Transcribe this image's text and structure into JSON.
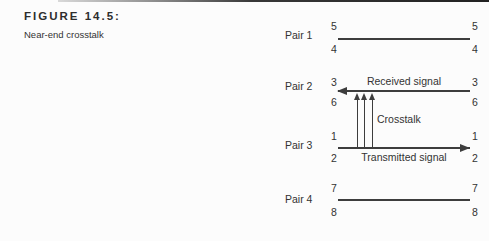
{
  "figure": {
    "title": "FIGURE 14.5:",
    "caption": "Near-end crosstalk"
  },
  "diagram": {
    "pairs": [
      {
        "label": "Pair 1",
        "top_wire": "5",
        "bottom_wire": "4",
        "line_style": "plain"
      },
      {
        "label": "Pair 2",
        "top_wire": "3",
        "bottom_wire": "6",
        "line_style": "arrow-left"
      },
      {
        "label": "Pair 3",
        "top_wire": "1",
        "bottom_wire": "2",
        "line_style": "arrow-right"
      },
      {
        "label": "Pair 4",
        "top_wire": "7",
        "bottom_wire": "8",
        "line_style": "plain"
      }
    ],
    "annotations": {
      "received_signal": "Received signal",
      "crosstalk": "Crosstalk",
      "transmitted_signal": "Transmitted signal"
    },
    "crosstalk_arrow_count": 3,
    "colors": {
      "line": "#3d3d3d",
      "text": "#333333",
      "rule_dark": "#222222",
      "background": "#fcfcfc"
    }
  }
}
